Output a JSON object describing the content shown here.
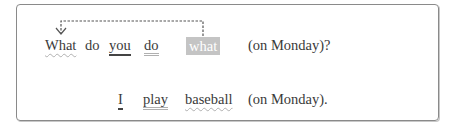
{
  "sentence1": {
    "words": [
      "What",
      "do",
      "you",
      "do",
      "what",
      "(on Monday)?"
    ]
  },
  "sentence2": {
    "words": [
      "I",
      "play",
      "baseball",
      "(on Monday)."
    ]
  },
  "arrow": {
    "from_word": "what",
    "to_word": "What",
    "style": "dashed"
  },
  "colors": {
    "border": "#8a8a8a",
    "highlight": "#c4c4c4",
    "text": "#3a3a3a"
  }
}
